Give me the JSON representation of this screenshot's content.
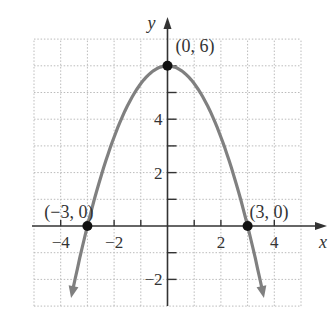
{
  "chart_data": {
    "type": "line",
    "title": "",
    "xlabel": "x",
    "ylabel": "y",
    "xlim": [
      -5,
      5
    ],
    "ylim": [
      -3,
      7
    ],
    "grid": true,
    "x_tick_labels": [
      {
        "value": -4,
        "label": "−4"
      },
      {
        "value": -2,
        "label": "−2"
      },
      {
        "value": 2,
        "label": "2"
      },
      {
        "value": 4,
        "label": "4"
      }
    ],
    "y_tick_labels": [
      {
        "value": 6,
        "label": ""
      },
      {
        "value": 4,
        "label": "4"
      },
      {
        "value": 2,
        "label": "2"
      },
      {
        "value": -2,
        "label": "−2"
      }
    ],
    "series": [
      {
        "name": "y = -2/3 x^2 + 6",
        "function": "-(2/3)*x^2 + 6",
        "x": [
          -3.55,
          -3,
          -2,
          -1,
          0,
          1,
          2,
          3,
          3.55
        ],
        "y": [
          -2.4,
          0,
          3.33,
          5.33,
          6,
          5.33,
          3.33,
          0,
          -2.4
        ],
        "color": "#808080"
      }
    ],
    "points": [
      {
        "x": 0,
        "y": 6,
        "label": "(0, 6)"
      },
      {
        "x": -3,
        "y": 0,
        "label": "(−3, 0)"
      },
      {
        "x": 3,
        "y": 0,
        "label": "(3, 0)"
      }
    ],
    "colors": {
      "curve": "#808080",
      "axis": "#333333",
      "grid": "#bbbbbb",
      "point": "#111111"
    }
  }
}
